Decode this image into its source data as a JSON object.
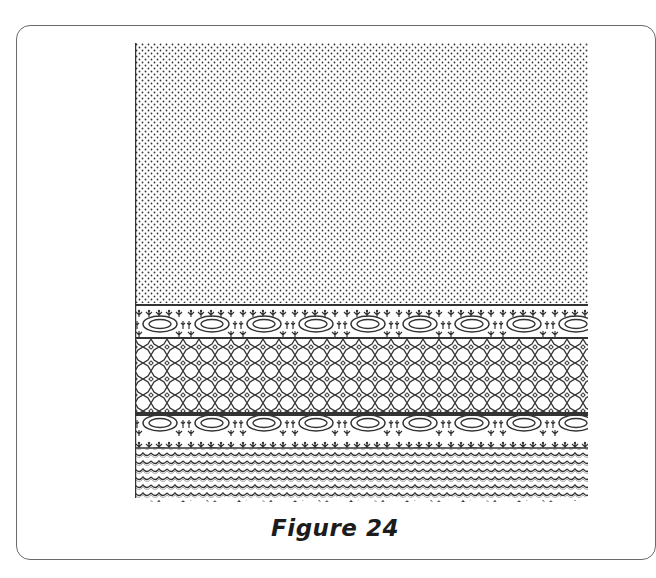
{
  "figure": {
    "caption": "Figure 24",
    "frame_color": "#6a6a6a",
    "ink_color": "#3a3a3a",
    "bands": [
      {
        "name": "dotted-fill",
        "pattern": "dots"
      },
      {
        "name": "oval-band-top",
        "pattern": "ovals-with-floral-sprigs"
      },
      {
        "name": "circle-lattice",
        "pattern": "octagonal-circles-with-diamonds"
      },
      {
        "name": "oval-band-bottom",
        "pattern": "ovals-with-floral-sprigs"
      },
      {
        "name": "wave-band",
        "pattern": "zigzag-waves-scalloped-edge"
      }
    ]
  }
}
